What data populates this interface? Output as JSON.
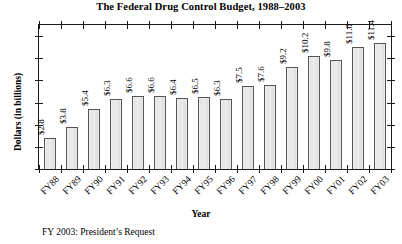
{
  "chart_data": {
    "type": "bar",
    "title": "The Federal Drug Control Budget, 1988–2003",
    "xlabel": "Year",
    "ylabel": "Dollars (in billions)",
    "categories": [
      "FY88",
      "FY89",
      "FY90",
      "FY91",
      "FY92",
      "FY93",
      "FY94",
      "FY95",
      "FY96",
      "FY97",
      "FY98",
      "FY99",
      "FY00",
      "FY01",
      "FY02",
      "FY03"
    ],
    "values": [
      2.8,
      3.8,
      5.4,
      6.3,
      6.6,
      6.6,
      6.4,
      6.5,
      6.3,
      7.5,
      7.6,
      9.2,
      10.2,
      9.8,
      11.0,
      11.4
    ],
    "data_labels": [
      "$2.8",
      "$3.8",
      "$5.4",
      "$6.3",
      "$6.6",
      "$6.6",
      "$6.4",
      "$6.5",
      "$6.3",
      "$7.5",
      "$7.6",
      "$9.2",
      "$10.2",
      "$9.8",
      "$11.0",
      "$11.4"
    ],
    "ylim": [
      0,
      13
    ],
    "yticks": [
      0,
      2,
      4,
      6,
      8,
      10,
      12
    ],
    "ytick_labels": [
      "0",
      "2",
      "4",
      "6",
      "8",
      "10",
      "12"
    ],
    "grid": false,
    "legend": false,
    "footnote": "FY 2003: President’s Request",
    "bar_fill_color": "#e8e8e8",
    "bar_border_color": "#555555",
    "axis_color": "#1a1a1a"
  }
}
